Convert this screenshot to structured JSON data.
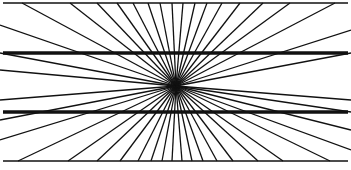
{
  "diagram": {
    "type": "hering-illusion",
    "center": [
      176,
      86
    ],
    "frame_lines": [
      {
        "name": "top-border-line",
        "y": 3,
        "width": 1.5
      },
      {
        "name": "upper-thick-line",
        "y": 53,
        "width": 3.5
      },
      {
        "name": "lower-thick-line",
        "y": 112,
        "width": 3.5
      },
      {
        "name": "bottom-border-line",
        "y": 161,
        "width": 1.5
      }
    ],
    "ray_ends_top_x": [
      22,
      70,
      97,
      117,
      133,
      148,
      160,
      172,
      183,
      195,
      207,
      222,
      240,
      263,
      290,
      335
    ],
    "ray_ends_bottom_x": [
      18,
      68,
      97,
      120,
      138,
      151,
      162,
      172,
      182,
      192,
      203,
      217,
      233,
      258,
      283,
      330
    ],
    "ray_ends_left_y": [
      25,
      53,
      70,
      100,
      120,
      140
    ],
    "ray_ends_right_y": [
      30,
      53,
      100,
      112,
      130,
      150
    ],
    "stroke_color": "#111111",
    "background": "#ffffff"
  }
}
